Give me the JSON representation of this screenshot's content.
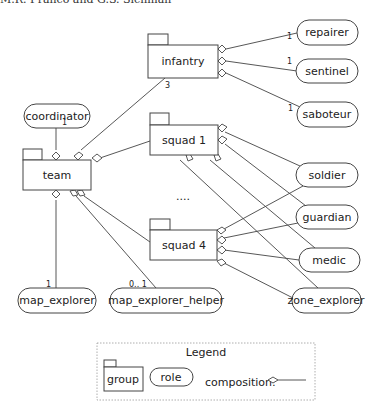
{
  "header": {
    "text": "M.R. Franco and G.S. Sichman"
  },
  "groups": {
    "infantry": "infantry",
    "team": "team",
    "squad1": "squad 1",
    "squad4": "squad 4"
  },
  "roles": {
    "coordinator": "coordinator",
    "repairer": "repairer",
    "sentinel": "sentinel",
    "saboteur": "saboteur",
    "soldier": "soldier",
    "guardian": "guardian",
    "medic": "medic",
    "zone_explorer": "zone_explorer",
    "map_explorer": "map_explorer",
    "map_explorer_helper": "map_explorer_helper"
  },
  "multiplicities": {
    "repairer": "1",
    "sentinel": "1",
    "saboteur": "1",
    "infantry_team": "3",
    "coordinator": "1",
    "map_explorer": "1",
    "map_explorer_helper": "0.. 1"
  },
  "ellipsis": "....",
  "legend": {
    "title": "Legend",
    "group": "group",
    "role": "role",
    "composition": "composition:"
  }
}
